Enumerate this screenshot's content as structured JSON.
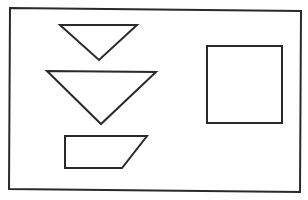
{
  "figure": {
    "width": 308,
    "height": 200,
    "background": "#ffffff",
    "stroke_color": "#2a2a2a",
    "frame": {
      "name": "outer-frame",
      "points": "10,8 301,11 300,192 9,189",
      "stroke_width": 2
    },
    "shapes": [
      {
        "name": "small-inverted-triangle",
        "kind": "triangle",
        "points": "60,25 137,25 99,60",
        "stroke_width": 2
      },
      {
        "name": "large-inverted-triangle",
        "kind": "triangle",
        "points": "47,71 156,72 101,124",
        "stroke_width": 2
      },
      {
        "name": "trapezoid",
        "kind": "trapezoid",
        "points": "65,136 147,136 122,168 65,168",
        "stroke_width": 2
      },
      {
        "name": "square",
        "kind": "square",
        "points": "207,46 282,46 282,123 207,123",
        "stroke_width": 2
      }
    ]
  }
}
